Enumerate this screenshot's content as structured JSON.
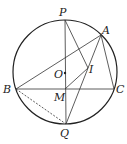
{
  "diagram": {
    "type": "geometry",
    "circle": {
      "cx": 65,
      "cy": 72,
      "r": 52
    },
    "points": {
      "P": {
        "x": 65,
        "y": 20,
        "label": "P"
      },
      "A": {
        "x": 101,
        "y": 35,
        "label": "A"
      },
      "B": {
        "x": 16,
        "y": 89,
        "label": "B"
      },
      "C": {
        "x": 114,
        "y": 89,
        "label": "C"
      },
      "O": {
        "x": 65,
        "y": 73,
        "label": "O"
      },
      "I": {
        "x": 88,
        "y": 68,
        "label": "I"
      },
      "M": {
        "x": 65,
        "y": 89,
        "label": "M"
      },
      "Q": {
        "x": 66,
        "y": 124,
        "label": "Q"
      }
    },
    "segments": [
      [
        "P",
        "Q"
      ],
      [
        "B",
        "C"
      ],
      [
        "B",
        "A"
      ],
      [
        "A",
        "C"
      ],
      [
        "P",
        "I"
      ],
      [
        "A",
        "Q"
      ],
      [
        "M",
        "I"
      ]
    ],
    "dashed_segments": [
      [
        "B",
        "Q"
      ]
    ]
  }
}
